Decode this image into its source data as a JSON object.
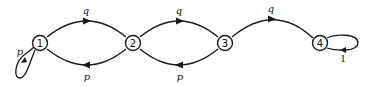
{
  "diagram": {
    "type": "markov-chain-state-diagram",
    "nodes": [
      {
        "id": "1",
        "label": "1"
      },
      {
        "id": "2",
        "label": "2"
      },
      {
        "id": "3",
        "label": "3"
      },
      {
        "id": "4",
        "label": "4"
      }
    ],
    "edges": [
      {
        "from": "1",
        "to": "2",
        "label": "q"
      },
      {
        "from": "2",
        "to": "1",
        "label": "p"
      },
      {
        "from": "2",
        "to": "3",
        "label": "q"
      },
      {
        "from": "3",
        "to": "2",
        "label": "p"
      },
      {
        "from": "3",
        "to": "4",
        "label": "q"
      },
      {
        "from": "1",
        "to": "1",
        "label": "p"
      },
      {
        "from": "4",
        "to": "4",
        "label": "1"
      }
    ]
  }
}
